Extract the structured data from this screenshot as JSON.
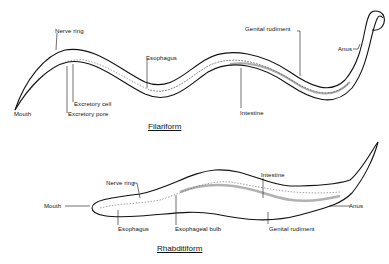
{
  "filariform": {
    "title": "Filariform",
    "labels": {
      "nerve_ring": "Nerve ring",
      "esophagus": "Esophagus",
      "genital_rudiment": "Genital rudiment",
      "anus": "Anus",
      "excretory_cell": "Excretory cell",
      "excretory_pore": "Excretory pore",
      "mouth": "Mouth",
      "intestine": "Intestine"
    }
  },
  "rhabditiform": {
    "title": "Rhabditiform",
    "labels": {
      "nerve_ring": "Nerve ring",
      "intestine": "Intestine",
      "mouth": "Mouth",
      "anus": "Anus",
      "esophagus": "Esophagus",
      "esophageal_bulb": "Esophageal bulb",
      "genital_rudiment": "Genital rudiment"
    }
  },
  "colors": {
    "ink": "#111111",
    "background": "#ffffff"
  }
}
